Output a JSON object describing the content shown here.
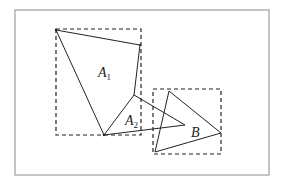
{
  "diagram": {
    "frame": {
      "x": 15,
      "y": 10,
      "width": 254,
      "height": 165,
      "stroke": "#888888"
    },
    "boxes": [
      {
        "id": "A1-bounding-box",
        "x": 56,
        "y": 29,
        "width": 85,
        "height": 106
      },
      {
        "id": "B-bounding-box",
        "x": 153,
        "y": 89,
        "width": 68,
        "height": 65
      }
    ],
    "polygons": {
      "A1": "56,30 140,45 134,95 104,135",
      "A2": "134,95 185,125 104,135",
      "B": "169,91 221,133 155,152"
    },
    "labels": [
      {
        "id": "A1",
        "text": "A",
        "sub": "1",
        "x": 98,
        "y": 77
      },
      {
        "id": "A2",
        "text": "A",
        "sub": "2",
        "x": 125,
        "y": 125
      },
      {
        "id": "B",
        "text": "B",
        "sub": "",
        "x": 191,
        "y": 137
      }
    ],
    "stroke_color": "#222222"
  }
}
